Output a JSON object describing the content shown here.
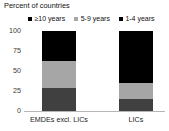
{
  "chart_data": {
    "type": "bar",
    "variant": "stacked-vertical-100",
    "title": "Percent of countries",
    "subtitle": "",
    "xlabel": "",
    "ylabel": "",
    "ylim": [
      0,
      100
    ],
    "yticks": [
      0,
      25,
      50,
      75,
      100
    ],
    "ytick_labels": [
      "0",
      "25",
      "50",
      "75",
      "100"
    ],
    "grid": false,
    "legend_position": "top",
    "categories": [
      "EMDEs excl. LICs",
      "LICs"
    ],
    "series": [
      {
        "name": "1-4 years",
        "color": "#404040",
        "values": [
          29,
          15
        ]
      },
      {
        "name": "5-9 years",
        "color": "#a6a6a6",
        "values": [
          33,
          20
        ]
      },
      {
        "name": "≥10 years",
        "color": "#000000",
        "values": [
          38,
          65
        ]
      }
    ],
    "stack_order_bottom_to_top": [
      "1-4 years",
      "5-9 years",
      "≥10 years"
    ],
    "legend_entries": [
      {
        "label": "≥10 years",
        "color": "#000000",
        "marker": "square"
      },
      {
        "label": "5-9 years",
        "color": "#a6a6a6",
        "marker": "square"
      },
      {
        "label": "1-4 years",
        "color": "#000000",
        "marker": "square"
      }
    ]
  },
  "axes": {
    "y_tick_labels": [
      "100",
      "75",
      "50",
      "25",
      "0"
    ],
    "x_tick_labels": [
      "EMDEs excl. LICs",
      "LICs"
    ]
  },
  "colors": {
    "background": "#ffffff",
    "axis_line": "#b6b6b6",
    "text": "#111111",
    "segment_1_4_years": "#404040",
    "segment_5_9_years": "#a6a6a6",
    "segment_10_plus_years": "#000000"
  }
}
